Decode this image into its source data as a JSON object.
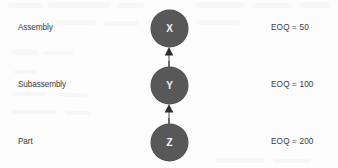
{
  "diagram": {
    "type": "bill-of-materials-tree",
    "orientation": "vertical",
    "arrow_direction": "upward",
    "node_color": "#585858",
    "node_text_color": "#f4f4f4",
    "text_color": "#3b3b3b",
    "background_color": "#fcfcfc",
    "levels": [
      {
        "label": "Assembly",
        "node": "X",
        "eoq": "EOQ  =  50"
      },
      {
        "label": "Subassembly",
        "node": "Y",
        "eoq": "EOQ  =  100"
      },
      {
        "label": "Part",
        "node": "Z",
        "eoq": "EOQ  =  200"
      }
    ],
    "edges": [
      {
        "from": "Z",
        "to": "Y"
      },
      {
        "from": "Y",
        "to": "X"
      }
    ]
  }
}
